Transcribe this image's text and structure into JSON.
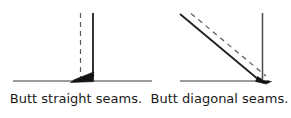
{
  "figure": {
    "title_left": "Butt straight seams.",
    "title_right": "Butt diagonal seams.",
    "stroke_color": "#262626",
    "background_color": "#ffffff",
    "panels": [
      {
        "id": "straight-seam-panel",
        "caption": "Butt straight seams.",
        "baseline": {
          "x1": 13,
          "y1": 81,
          "x2": 152,
          "y2": 81
        },
        "solid_line": {
          "x1": 93,
          "y1": 13,
          "x2": 93,
          "y2": 79
        },
        "dashed_line": {
          "x1": 80,
          "y1": 13,
          "x2": 80,
          "y2": 81
        },
        "wedge_points": "93,74 93,81 71,82"
      },
      {
        "id": "diagonal-seam-panel",
        "caption": "Butt diagonal seams.",
        "baseline": {
          "x1": 180,
          "y1": 81,
          "x2": 256,
          "y2": 81
        },
        "solid_line": {
          "x1": 262,
          "y1": 13,
          "x2": 262,
          "y2": 80
        },
        "diagonal_line": {
          "x1": 180,
          "y1": 14,
          "x2": 259,
          "y2": 80
        },
        "dashed_line": {
          "x1": 190,
          "y1": 13,
          "x2": 266,
          "y2": 77
        },
        "wedge_points": "262,73 266,80 252,82"
      }
    ]
  }
}
